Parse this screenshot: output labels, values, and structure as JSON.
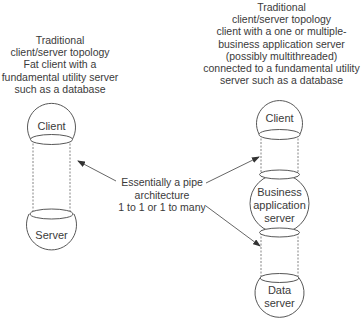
{
  "left_topology": {
    "caption": [
      "Traditional",
      "client/server topology",
      "Fat client with a",
      "fundamental utility server",
      "such as a database"
    ],
    "nodes": [
      {
        "label": [
          "Client"
        ]
      },
      {
        "label": [
          "Server"
        ]
      }
    ]
  },
  "right_topology": {
    "caption": [
      "Traditional",
      "client/server topology",
      "client with a one or multiple-",
      "business application server",
      "(possibly multithreaded)",
      "connected to a fundamental utility",
      "server such as a database"
    ],
    "nodes": [
      {
        "label": [
          "Client"
        ]
      },
      {
        "label": [
          "Business",
          "application",
          "server"
        ]
      },
      {
        "label": [
          "Data",
          "server"
        ]
      }
    ]
  },
  "center_annotation": {
    "lines": [
      "Essentially a pipe",
      "architecture",
      "1 to 1 or 1 to many"
    ]
  },
  "colors": {
    "stroke": "#444444",
    "text": "#3a3a3a",
    "background": "#ffffff"
  }
}
